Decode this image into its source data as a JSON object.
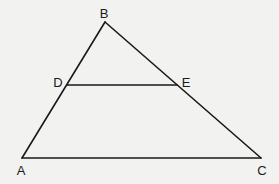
{
  "diagram": {
    "type": "geometry-triangle",
    "points": {
      "A": {
        "label": "A",
        "x": 22,
        "y": 158,
        "lx": 21,
        "ly": 175
      },
      "B": {
        "label": "B",
        "x": 105,
        "y": 22,
        "lx": 104,
        "ly": 18
      },
      "C": {
        "label": "C",
        "x": 261,
        "y": 158,
        "lx": 262,
        "ly": 175
      },
      "D": {
        "label": "D",
        "x": 67,
        "y": 85,
        "lx": 58,
        "ly": 87
      },
      "E": {
        "label": "E",
        "x": 177,
        "y": 85,
        "lx": 186,
        "ly": 87
      }
    },
    "segments": [
      "AB",
      "BC",
      "AC",
      "DE"
    ],
    "line_color": "#1a1a1a",
    "background": "#f2f2f0"
  }
}
